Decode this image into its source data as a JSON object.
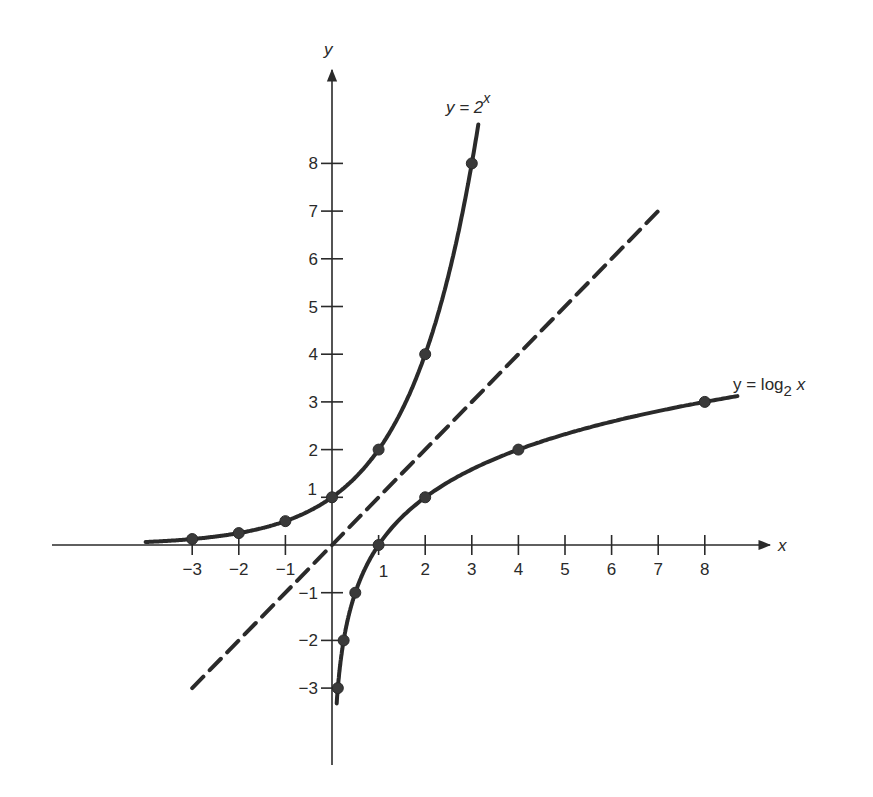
{
  "chart_data": {
    "type": "line",
    "title": "",
    "xlabel": "x",
    "ylabel": "y",
    "xlim": [
      -4,
      9
    ],
    "ylim": [
      -4,
      9
    ],
    "grid": false,
    "x_ticks": [
      -3,
      -2,
      -1,
      1,
      2,
      3,
      4,
      5,
      6,
      7,
      8
    ],
    "y_ticks": [
      -3,
      -2,
      -1,
      1,
      2,
      3,
      4,
      5,
      6,
      7,
      8
    ],
    "x_tick_labels": [
      "−3",
      "−2",
      "−1",
      "1",
      "2",
      "3",
      "4",
      "5",
      "6",
      "7",
      "8"
    ],
    "y_tick_labels": [
      "−3",
      "−2",
      "−1",
      "1",
      "2",
      "3",
      "4",
      "5",
      "6",
      "7",
      "8"
    ],
    "series": [
      {
        "name": "y = 2^x",
        "label": "y = 2",
        "label_sup": "x",
        "style": "solid",
        "points": [
          {
            "x": -3,
            "y": 0.125
          },
          {
            "x": -2,
            "y": 0.25
          },
          {
            "x": -1,
            "y": 0.5
          },
          {
            "x": 0,
            "y": 1
          },
          {
            "x": 1,
            "y": 2
          },
          {
            "x": 2,
            "y": 4
          },
          {
            "x": 3,
            "y": 8
          }
        ],
        "domain": [
          -4,
          3.15
        ]
      },
      {
        "name": "y = log2 x",
        "label": "y = log",
        "label_sub": "2",
        "label_tail": " x",
        "style": "solid",
        "points": [
          {
            "x": 0.125,
            "y": -3
          },
          {
            "x": 0.25,
            "y": -2
          },
          {
            "x": 0.5,
            "y": -1
          },
          {
            "x": 1,
            "y": 0
          },
          {
            "x": 2,
            "y": 1
          },
          {
            "x": 4,
            "y": 2
          },
          {
            "x": 8,
            "y": 3
          }
        ],
        "domain": [
          0.1,
          8.7
        ]
      },
      {
        "name": "y = x",
        "label": "",
        "style": "dashed",
        "points": [
          {
            "x": -3,
            "y": -3
          },
          {
            "x": 7.1,
            "y": 7.1
          }
        ]
      }
    ],
    "annotations": [
      {
        "text": "y = 2^x",
        "near": {
          "x": 2.6,
          "y": 9.2
        }
      },
      {
        "text": "y = log2 x",
        "near": {
          "x": 8.7,
          "y": 3.3
        }
      }
    ]
  },
  "axes": {
    "x_label": "x",
    "y_label": "y"
  },
  "labels": {
    "exp_main": "y = 2",
    "exp_sup": "x",
    "log_main": "y = log",
    "log_sub": "2",
    "log_tail": " x"
  },
  "colors": {
    "ink": "#2a2a2a",
    "background": "#ffffff"
  }
}
